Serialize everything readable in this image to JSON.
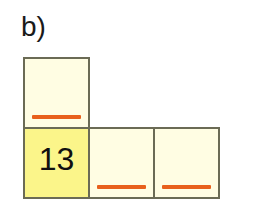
{
  "figure": {
    "part_label": "b)",
    "colors": {
      "border": "#6b6b55",
      "cell_fill": "#fffde3",
      "cell_fill_highlight": "#fbf58a",
      "blank_line": "#e8601c",
      "text": "#101010",
      "background": "#ffffff"
    },
    "rows": [
      {
        "name": "top-row",
        "cells": [
          {
            "value": "",
            "blank": true,
            "highlight": false
          }
        ]
      },
      {
        "name": "bottom-row",
        "cells": [
          {
            "value": "13",
            "blank": false,
            "highlight": true
          },
          {
            "value": "",
            "blank": true,
            "highlight": false
          },
          {
            "value": "",
            "blank": true,
            "highlight": false
          }
        ]
      }
    ]
  }
}
